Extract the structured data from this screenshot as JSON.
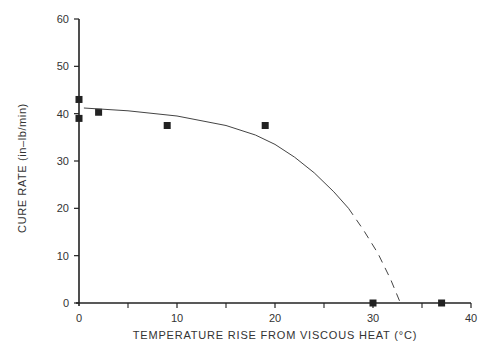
{
  "chart_data": {
    "type": "scatter",
    "title": "",
    "xlabel": "TEMPERATURE RISE FROM VISCOUS HEAT (°C)",
    "xlabel_main": "TEMPERATURE RISE FROM VISCOUS HEAT (",
    "xlabel_unit": "°C)",
    "ylabel": "CURE RATE (in–lb/min)",
    "xlim": [
      0,
      40
    ],
    "ylim": [
      0,
      60
    ],
    "x_ticks": [
      0,
      10,
      20,
      30,
      40
    ],
    "x_minor_ticks": [
      5,
      15,
      25,
      35
    ],
    "y_ticks": [
      0,
      10,
      20,
      30,
      40,
      50,
      60
    ],
    "grid": false,
    "series": [
      {
        "name": "measured",
        "marker": "square",
        "points": [
          {
            "x": 0,
            "y": 43
          },
          {
            "x": 0,
            "y": 39
          },
          {
            "x": 2,
            "y": 40.3
          },
          {
            "x": 9,
            "y": 37.5
          },
          {
            "x": 19,
            "y": 37.5
          },
          {
            "x": 30,
            "y": 0
          },
          {
            "x": 37,
            "y": 0
          }
        ]
      },
      {
        "name": "fit-solid",
        "style": "solid",
        "points": [
          {
            "x": 0.5,
            "y": 41.2
          },
          {
            "x": 5,
            "y": 40.6
          },
          {
            "x": 10,
            "y": 39.5
          },
          {
            "x": 15,
            "y": 37.5
          },
          {
            "x": 18,
            "y": 35.5
          },
          {
            "x": 20,
            "y": 33.5
          },
          {
            "x": 22,
            "y": 30.8
          },
          {
            "x": 24,
            "y": 27.5
          },
          {
            "x": 26,
            "y": 23.5
          },
          {
            "x": 27.5,
            "y": 20
          }
        ]
      },
      {
        "name": "fit-dashed",
        "style": "dashed",
        "points": [
          {
            "x": 27.5,
            "y": 20
          },
          {
            "x": 29,
            "y": 15.5
          },
          {
            "x": 30.5,
            "y": 10.5
          },
          {
            "x": 31.8,
            "y": 5
          },
          {
            "x": 32.8,
            "y": 0
          }
        ]
      }
    ]
  }
}
